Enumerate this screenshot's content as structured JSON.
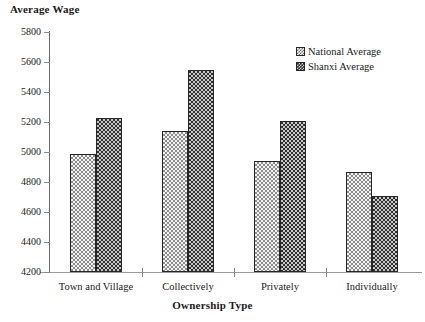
{
  "chart_data": {
    "type": "bar",
    "title": "",
    "ylabel": "Average Wage",
    "xlabel": "Ownership Type",
    "categories": [
      "Town and Village",
      "Collectively",
      "Privately",
      "Individually"
    ],
    "series": [
      {
        "name": "National Average",
        "values": [
          4990,
          5140,
          4940,
          4870
        ],
        "color": "#f2f2f2",
        "pattern": "light-dotted"
      },
      {
        "name": "Shanxi Average",
        "values": [
          5230,
          5545,
          5210,
          4710
        ],
        "color": "#2f2f2f",
        "pattern": "dark-dotted"
      }
    ],
    "ylim": [
      4200,
      5800
    ],
    "ytick_step": 200,
    "yticks": [
      5800,
      5600,
      5400,
      5200,
      5000,
      4800,
      4600,
      4400,
      4200
    ],
    "ytick_labels": [
      "5800",
      "5600",
      "5400",
      "5200",
      "5000",
      "4800",
      "4600",
      "4400",
      "4200"
    ],
    "grid": false,
    "legend_position": "top-right",
    "legend_entries": [
      "National Average",
      "Shanxi Average"
    ]
  },
  "axes": {
    "y_title": "Average Wage",
    "x_title": "Ownership Type"
  }
}
